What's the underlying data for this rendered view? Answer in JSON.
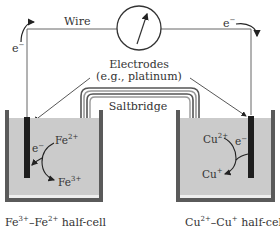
{
  "diagram": {
    "type": "electrochemical-cell",
    "labels": {
      "wire": "Wire",
      "electrodes_line1": "Electrodes",
      "electrodes_line2": "(e.g., platinum)",
      "saltbridge": "Saltbridge",
      "electron_left": "e",
      "electron_right": "e",
      "electron_sup": "−"
    },
    "left_half_cell": {
      "caption": "Fe³⁺–Fe²⁺ half-cell",
      "caption_parts": {
        "a": "Fe",
        "a_sup": "3+",
        "dash": "–Fe",
        "b_sup": "2+",
        "rest": " half-cell"
      },
      "reactant": {
        "base": "Fe",
        "sup": "2+"
      },
      "product": {
        "base": "Fe",
        "sup": "3+"
      },
      "electron": {
        "base": "e",
        "sup": "−"
      }
    },
    "right_half_cell": {
      "caption": "Cu²⁺–Cu⁺ half-cell",
      "caption_parts": {
        "a": "Cu",
        "a_sup": "2+",
        "dash": "–Cu",
        "b_sup": "+",
        "rest": " half-cell"
      },
      "reactant": {
        "base": "Cu",
        "sup": "2+"
      },
      "product": {
        "base": "Cu",
        "sup": "+"
      },
      "electron": {
        "base": "e",
        "sup": "−"
      }
    },
    "colors": {
      "line": "#555555",
      "solution": "#c8c8c8",
      "beaker_wall": "#5a5a5a",
      "electrode": "#1e1e1e",
      "text": "#333333",
      "bridge": "#555555"
    }
  }
}
